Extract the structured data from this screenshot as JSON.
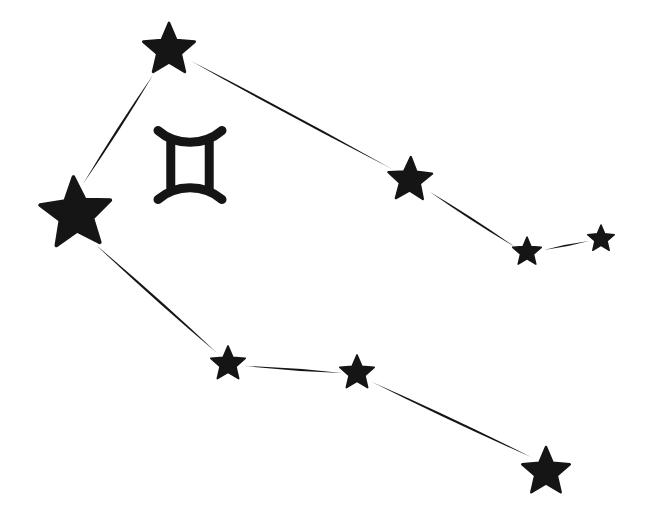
{
  "figure": {
    "title": "Gemini Constellation",
    "background_color": "#ffffff",
    "ink_color": "#151515",
    "width": 652,
    "height": 526
  },
  "zodiac_symbol": {
    "name": "gemini-symbol",
    "glyph": "♊",
    "label": "Gemini",
    "color": "#151515",
    "center_x": 190,
    "center_y": 165,
    "width": 64,
    "height": 69,
    "stroke": 9
  },
  "stars": [
    {
      "id": "star-castor-top",
      "label": "Castor",
      "cx": 169,
      "cy": 50,
      "radius": 27,
      "rotation": 0,
      "color": "#151515",
      "size_class": "medium"
    },
    {
      "id": "star-bright-left",
      "label": "Pollux",
      "cx": 76,
      "cy": 214,
      "radius": 37,
      "rotation": -4,
      "color": "#151515",
      "size_class": "large"
    },
    {
      "id": "star-upper-mid-right",
      "label": "Wasat",
      "cx": 410,
      "cy": 180,
      "radius": 23,
      "rotation": 2,
      "color": "#151515",
      "size_class": "medium"
    },
    {
      "id": "star-upper-small-right",
      "label": "Mebsuta",
      "cx": 527,
      "cy": 252,
      "radius": 15,
      "rotation": 0,
      "color": "#151515",
      "size_class": "small"
    },
    {
      "id": "star-upper-far-right",
      "label": "Propus",
      "cx": 601,
      "cy": 239,
      "radius": 14,
      "rotation": 0,
      "color": "#151515",
      "size_class": "small"
    },
    {
      "id": "star-lower-left",
      "label": "Alhena",
      "cx": 228,
      "cy": 364,
      "radius": 18,
      "rotation": 0,
      "color": "#151515",
      "size_class": "small"
    },
    {
      "id": "star-lower-mid",
      "label": "Mekbuda",
      "cx": 357,
      "cy": 373,
      "radius": 18,
      "rotation": 0,
      "color": "#151515",
      "size_class": "small"
    },
    {
      "id": "star-lower-right",
      "label": "Tejat",
      "cx": 546,
      "cy": 472,
      "radius": 25,
      "rotation": 0,
      "color": "#151515",
      "size_class": "medium"
    }
  ],
  "lines": [
    {
      "id": "line-castor-to-pollux",
      "from": "star-castor-top",
      "to": "star-bright-left",
      "x1": 153,
      "y1": 75,
      "x2": 83,
      "y2": 184,
      "max_width": 4.6,
      "color": "#151515"
    },
    {
      "id": "line-castor-to-wasat",
      "from": "star-castor-top",
      "to": "star-upper-mid-right",
      "x1": 191,
      "y1": 61,
      "x2": 392,
      "y2": 169,
      "max_width": 4.8,
      "color": "#151515"
    },
    {
      "id": "line-wasat-to-mebsuta",
      "from": "star-upper-mid-right",
      "to": "star-upper-small-right",
      "x1": 430,
      "y1": 192,
      "x2": 515,
      "y2": 247,
      "max_width": 4.2,
      "color": "#151515"
    },
    {
      "id": "line-mebsuta-to-propus",
      "from": "star-upper-small-right",
      "to": "star-upper-far-right",
      "x1": 544,
      "y1": 250,
      "x2": 589,
      "y2": 241,
      "max_width": 3.4,
      "color": "#151515"
    },
    {
      "id": "line-pollux-to-alhena",
      "from": "star-bright-left",
      "to": "star-lower-left",
      "x1": 96,
      "y1": 245,
      "x2": 217,
      "y2": 353,
      "max_width": 4.8,
      "color": "#151515"
    },
    {
      "id": "line-alhena-to-mekbuda",
      "from": "star-lower-left",
      "to": "star-lower-mid",
      "x1": 245,
      "y1": 366,
      "x2": 342,
      "y2": 373,
      "max_width": 4.0,
      "color": "#151515"
    },
    {
      "id": "line-mekbuda-to-tejat",
      "from": "star-lower-mid",
      "to": "star-lower-right",
      "x1": 372,
      "y1": 382,
      "x2": 531,
      "y2": 457,
      "max_width": 4.6,
      "color": "#151515"
    }
  ]
}
